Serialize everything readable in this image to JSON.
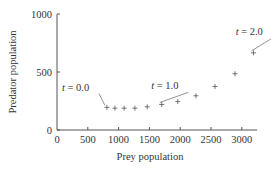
{
  "chart_data": {
    "type": "scatter",
    "title": "",
    "xlabel": "Prey population",
    "ylabel": "Predator population",
    "xlim": [
      0,
      3200
    ],
    "ylim": [
      0,
      1000
    ],
    "xticks": [
      0,
      500,
      1000,
      1500,
      2000,
      2500,
      3000
    ],
    "yticks": [
      0,
      500,
      1000
    ],
    "xtick_labels": [
      "0",
      "500",
      "1000",
      "1500",
      "2000",
      "2500",
      "3000"
    ],
    "ytick_labels": [
      "0",
      "500",
      "1000"
    ],
    "grid": false,
    "marker": "+",
    "points": [
      {
        "x": 810,
        "y": 195
      },
      {
        "x": 940,
        "y": 188
      },
      {
        "x": 1090,
        "y": 188
      },
      {
        "x": 1265,
        "y": 188
      },
      {
        "x": 1465,
        "y": 200
      },
      {
        "x": 1700,
        "y": 220
      },
      {
        "x": 1960,
        "y": 245
      },
      {
        "x": 2255,
        "y": 295
      },
      {
        "x": 2565,
        "y": 375
      },
      {
        "x": 2890,
        "y": 485
      },
      {
        "x": 3190,
        "y": 665
      }
    ],
    "annotations": [
      {
        "text": "t = 0.0",
        "point_index": 0,
        "label_x": 80,
        "label_y": 340
      },
      {
        "text": "t = 1.0",
        "point_index": 5,
        "label_x": 1530,
        "label_y": 350
      },
      {
        "text": "t = 2.0",
        "point_index": 10,
        "label_x": 2900,
        "label_y": 820
      }
    ]
  }
}
